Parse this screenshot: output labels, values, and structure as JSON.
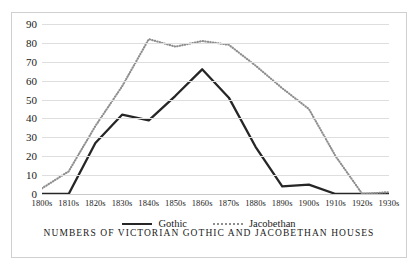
{
  "caption": "NUMBERS OF VICTORIAN GOTHIC AND JACOBETHAN HOUSES",
  "legend": {
    "gothic_label": "Gothic",
    "jacobethan_label": "Jacobethan"
  },
  "colors": {
    "gothic": "#262626",
    "jacobethan": "#8e8e8e",
    "gridline": "#dedede",
    "frame": "#cfcfcf",
    "text": "#1a1a1a",
    "background": "#ffffff"
  },
  "chart_data": {
    "type": "line",
    "title": "NUMBERS OF VICTORIAN GOTHIC AND JACOBETHAN HOUSES",
    "xlabel": "",
    "ylabel": "",
    "ylim": [
      0,
      90
    ],
    "yticks": [
      0,
      10,
      20,
      30,
      40,
      50,
      60,
      70,
      80,
      90
    ],
    "ytick_labels": [
      "0",
      "10",
      "20",
      "30",
      "40",
      "50",
      "60",
      "70",
      "80",
      "90"
    ],
    "grid": true,
    "legend_position": "bottom",
    "categories": [
      "1800s",
      "1810s",
      "1820s",
      "1830s",
      "1840s",
      "1850s",
      "1860s",
      "1870s",
      "1880s",
      "1890s",
      "1900s",
      "1910s",
      "1920s",
      "1930s"
    ],
    "series": [
      {
        "name": "Gothic",
        "style": "solid",
        "color": "#262626",
        "values": [
          0,
          0,
          27,
          42,
          39,
          52,
          66,
          51,
          25,
          4,
          5,
          0,
          0,
          0
        ]
      },
      {
        "name": "Jacobethan",
        "style": "dotted",
        "color": "#8e8e8e",
        "values": [
          3,
          12,
          36,
          57,
          82,
          78,
          81,
          79,
          68,
          56,
          45,
          20,
          0,
          1
        ]
      }
    ]
  }
}
